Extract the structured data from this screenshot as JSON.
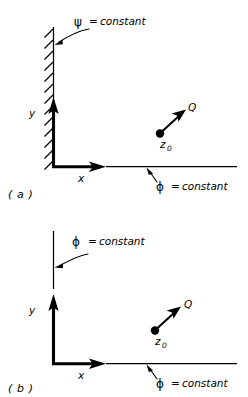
{
  "figure": {
    "background_color": "#ffffff",
    "ink_color": "#000000",
    "panels": [
      {
        "id": "panel-a",
        "caption": "( a )",
        "boundary_label": {
          "symbol": "ψ",
          "equals": "=",
          "value": "constant",
          "full": "ψ = constant"
        },
        "boundary_kind": "hatched-wall",
        "axis_label_y": "y",
        "axis_label_x": "x",
        "x_axis_label": {
          "symbol": "ϕ",
          "equals": "=",
          "value": "constant",
          "full": "ϕ = constant"
        },
        "source": {
          "vector_label": "Q",
          "point_label": "z",
          "point_subscript": "0",
          "point_label_full": "z0"
        }
      },
      {
        "id": "panel-b",
        "caption": "( b )",
        "boundary_label": {
          "symbol": "ϕ",
          "equals": "=",
          "value": "constant",
          "full": "ϕ = constant"
        },
        "boundary_kind": "plain-line",
        "axis_label_y": "y",
        "axis_label_x": "x",
        "x_axis_label": {
          "symbol": "ϕ",
          "equals": "=",
          "value": "constant",
          "full": "ϕ = constant"
        },
        "source": {
          "vector_label": "Q",
          "point_label": "z",
          "point_subscript": "0",
          "point_label_full": "z0"
        }
      }
    ]
  }
}
